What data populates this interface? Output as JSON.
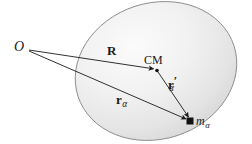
{
  "figure": {
    "background_color": "#ffffff",
    "body_fill_light": "#f2f2f2",
    "body_fill_dark": "#d8d8d8",
    "body_outline_color": "#8c8c8c",
    "vector_color": "#1a1a1a",
    "label_color": "#1a1a1a"
  },
  "labels": {
    "origin": "O",
    "cm": "CM",
    "vector_R": "R",
    "vector_r_alpha_base": "r",
    "vector_r_alpha_sub": "α",
    "vector_r_prime_alpha_base": "r",
    "vector_r_prime_alpha_prime": "′",
    "vector_r_prime_alpha_sub": "α",
    "mass_base": "m",
    "mass_sub": "α"
  },
  "geometry": {
    "origin_point": {
      "x": 29,
      "y": 50
    },
    "cm_point": {
      "x": 157,
      "y": 70
    },
    "mass_point": {
      "x": 190,
      "y": 121
    },
    "body_ellipse": {
      "cx": 156,
      "cy": 71,
      "rx": 82,
      "ry": 68,
      "rotation_deg": -18
    }
  },
  "vectors": [
    {
      "name": "R",
      "from": "origin",
      "to": "cm"
    },
    {
      "name": "r_alpha",
      "from": "origin",
      "to": "mass"
    },
    {
      "name": "r_prime_alpha",
      "from": "cm",
      "to": "mass"
    }
  ]
}
